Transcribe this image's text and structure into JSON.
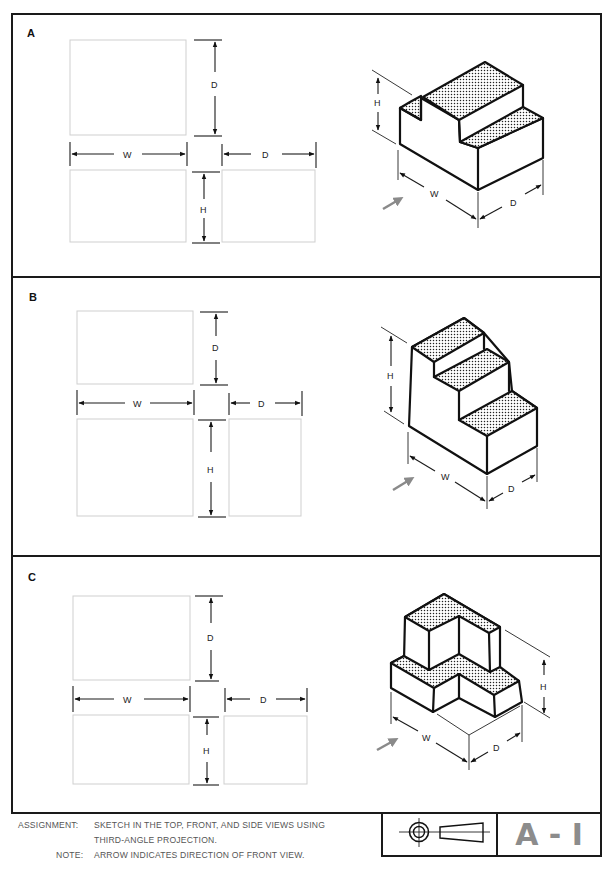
{
  "panels": [
    {
      "id": "A",
      "label": "A",
      "dims": {
        "top_d": "D",
        "width": "W",
        "side_d": "D",
        "height": "H"
      },
      "iso_dims": {
        "h": "H",
        "w": "W",
        "d": "D"
      }
    },
    {
      "id": "B",
      "label": "B",
      "dims": {
        "top_d": "D",
        "width": "W",
        "side_d": "D",
        "height": "H"
      },
      "iso_dims": {
        "h": "H",
        "w": "W",
        "d": "D"
      }
    },
    {
      "id": "C",
      "label": "C",
      "dims": {
        "top_d": "D",
        "width": "W",
        "side_d": "D",
        "height": "H"
      },
      "iso_dims": {
        "h": "H",
        "w": "W",
        "d": "D"
      }
    }
  ],
  "footer": {
    "assignment_label": "ASSIGNMENT:",
    "assignment_line1": "SKETCH IN THE TOP, FRONT, AND SIDE VIEWS USING",
    "assignment_line2": "THIRD-ANGLE PROJECTION.",
    "note_label": "NOTE:",
    "note_text": "ARROW INDICATES DIRECTION OF FRONT VIEW."
  },
  "title_block": {
    "symbol": "third-angle-projection-symbol",
    "sheet_code": "A - I"
  },
  "colors": {
    "line": "#1a1a1a",
    "box": "#cfcfcf",
    "code": "#8c8c8c",
    "arrow": "#8a8a8a"
  }
}
